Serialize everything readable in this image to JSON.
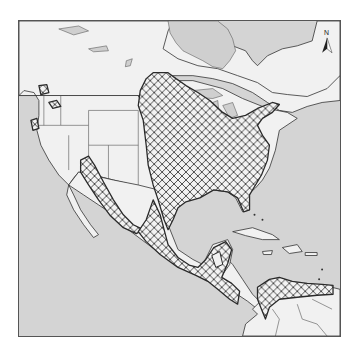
{
  "map": {
    "type": "species-range-distribution",
    "region": "North America, Central America, Caribbean, northern South America",
    "north_arrow_label": "N",
    "legend": [],
    "colors": {
      "ocean": "#d4d4d4",
      "land": "#f1f1f1",
      "range_hatch": "#3a3a3a",
      "outline": "#333333",
      "frame": "#555555"
    },
    "range_fill": "crosshatch",
    "range_areas": [
      "Eastern and central United States",
      "Southern Great Lakes and New England",
      "Sierra Madre / western Mexico",
      "Eastern Mexico and Gulf coast",
      "Central America",
      "Northern Colombia and Venezuela"
    ]
  }
}
